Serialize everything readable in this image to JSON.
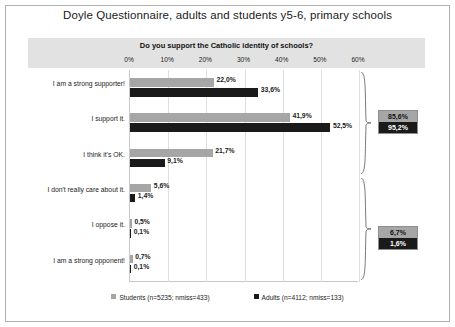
{
  "title": "Doyle Questionnaire, adults and students y5-6, primary schools",
  "subtitle": "Do you support the Catholic identity of schools?",
  "legend": [
    {
      "swatch": "students",
      "label": "Students (n=5235; nmiss=433)"
    },
    {
      "swatch": "adults",
      "label": "Adults (n=4112; nmiss=133)"
    }
  ],
  "summaries": [
    {
      "students": "85,6%",
      "adults": "95,2%"
    },
    {
      "students": "6,7%",
      "adults": "1,6%"
    }
  ],
  "chart_data": {
    "type": "bar",
    "orientation": "horizontal",
    "title": "Doyle Questionnaire, adults and students y5-6, primary schools",
    "subtitle": "Do you support the Catholic identity of schools?",
    "xlabel": "",
    "ylabel": "",
    "xlim": [
      0,
      60
    ],
    "xticks": [
      "0%",
      "10%",
      "20%",
      "30%",
      "40%",
      "50%",
      "60%"
    ],
    "xtick_values": [
      0,
      10,
      20,
      30,
      40,
      50,
      60
    ],
    "grid": true,
    "legend_position": "bottom",
    "categories": [
      "I am a strong supporter!",
      "I support it.",
      "I think it's OK.",
      "I don't really care about it.",
      "I oppose it.",
      "I am a strong opponent!"
    ],
    "series": [
      {
        "name": "Students (n=5235; nmiss=433)",
        "color": "#a6a6a6",
        "values": [
          22.0,
          41.9,
          21.7,
          5.6,
          0.5,
          0.7
        ],
        "labels": [
          "22,0%",
          "41,9%",
          "21,7%",
          "5,6%",
          "0,5%",
          "0,7%"
        ]
      },
      {
        "name": "Adults (n=4112; nmiss=133)",
        "color": "#1a1a1a",
        "values": [
          33.6,
          52.5,
          9.1,
          1.4,
          0.1,
          0.1
        ],
        "labels": [
          "33,6%",
          "52,5%",
          "9,1%",
          "1,4%",
          "0,1%",
          "0,1%"
        ]
      }
    ],
    "annotations": [
      {
        "name": "supportive-total",
        "covers": [
          "I am a strong supporter!",
          "I support it.",
          "I think it's OK."
        ],
        "students": "85,6%",
        "adults": "95,2%"
      },
      {
        "name": "non-supportive-total",
        "covers": [
          "I don't really care about it.",
          "I oppose it.",
          "I am a strong opponent!"
        ],
        "students": "6,7%",
        "adults": "1,6%"
      }
    ]
  }
}
